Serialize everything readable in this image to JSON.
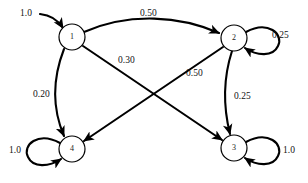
{
  "figure": {
    "type": "state-transition-diagram",
    "background": "#ffffff",
    "stroke_color": "#000000",
    "node_fill": "#ffffff"
  },
  "nodes": [
    {
      "id": "1",
      "label": "1",
      "cx": 72,
      "cy": 37,
      "r": 13
    },
    {
      "id": "2",
      "label": "2",
      "cx": 234,
      "cy": 38,
      "r": 13
    },
    {
      "id": "3",
      "label": "3",
      "cx": 234,
      "cy": 148,
      "r": 13
    },
    {
      "id": "4",
      "label": "4",
      "cx": 72,
      "cy": 149,
      "r": 13
    }
  ],
  "edges": [
    {
      "id": "start-1",
      "from": "",
      "to": "1",
      "label": "1.0",
      "label_x": 20,
      "label_y": 8
    },
    {
      "id": "1-2",
      "from": "1",
      "to": "2",
      "label": "0.50",
      "label_x": 140,
      "label_y": 8
    },
    {
      "id": "1-3",
      "from": "1",
      "to": "3",
      "label": "0.30",
      "label_x": 118,
      "label_y": 55
    },
    {
      "id": "1-4",
      "from": "1",
      "to": "4",
      "label": "0.20",
      "label_x": 33,
      "label_y": 89
    },
    {
      "id": "2-4",
      "from": "2",
      "to": "4",
      "label": "0.50",
      "label_x": 186,
      "label_y": 68
    },
    {
      "id": "2-2",
      "from": "2",
      "to": "2",
      "label": "0.25",
      "label_x": 272,
      "label_y": 30
    },
    {
      "id": "2-3",
      "from": "2",
      "to": "3",
      "label": "0.25",
      "label_x": 234,
      "label_y": 91
    },
    {
      "id": "3-3",
      "from": "3",
      "to": "3",
      "label": "1.0",
      "label_x": 283,
      "label_y": 145
    },
    {
      "id": "4-4",
      "from": "4",
      "to": "4",
      "label": "1.0",
      "label_x": 9,
      "label_y": 145
    }
  ]
}
